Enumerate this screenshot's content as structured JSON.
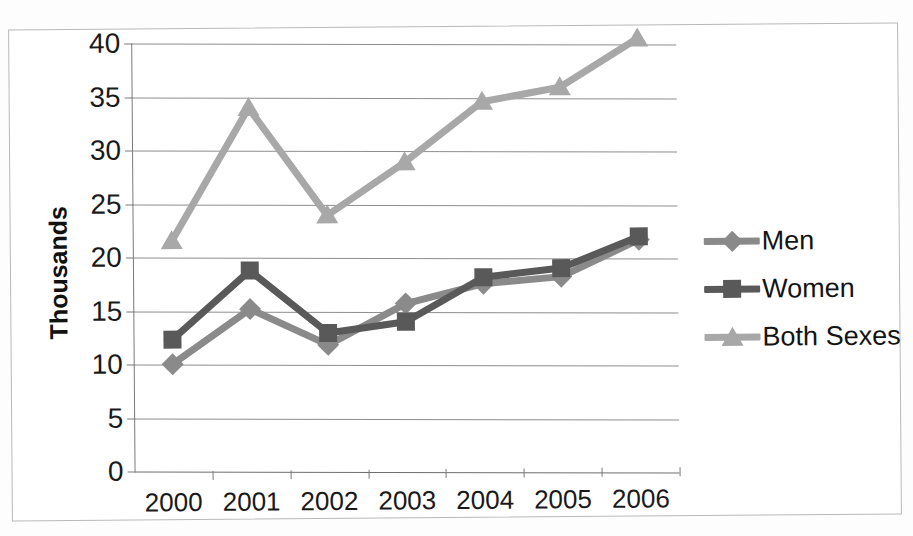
{
  "chart_data": {
    "type": "line",
    "title": "",
    "xlabel": "",
    "ylabel": "Thousands",
    "categories": [
      "2000",
      "2001",
      "2002",
      "2003",
      "2004",
      "2005",
      "2006"
    ],
    "ylim": [
      0,
      40
    ],
    "ytick_step": 5,
    "yticks": [
      "0",
      "5",
      "10",
      "15",
      "20",
      "25",
      "30",
      "35",
      "40"
    ],
    "grid": true,
    "legend_position": "right",
    "series": [
      {
        "name": "Men",
        "color": "#8a8a8a",
        "marker": "diamond",
        "values": [
          10.0,
          15.1,
          11.7,
          15.5,
          17.3,
          17.9,
          21.3
        ]
      },
      {
        "name": "Women",
        "color": "#595959",
        "marker": "square",
        "values": [
          12.3,
          18.7,
          12.8,
          13.8,
          17.9,
          18.7,
          21.6
        ]
      },
      {
        "name": "Both Sexes",
        "color": "#a8a8a8",
        "marker": "triangle",
        "values": [
          21.5,
          33.9,
          23.8,
          28.7,
          34.3,
          35.6,
          40.1
        ]
      }
    ]
  },
  "legend": {
    "items": [
      {
        "label": "Men"
      },
      {
        "label": "Women"
      },
      {
        "label": "Both Sexes"
      }
    ]
  },
  "colors": {
    "men": "#8a8a8a",
    "women": "#595959",
    "both_sexes": "#a8a8a8",
    "gridline": "#8e8e8e",
    "axis": "#7a7a7a",
    "border": "#b9b9b9",
    "background": "#ffffff",
    "text": "#1a1a1a"
  }
}
